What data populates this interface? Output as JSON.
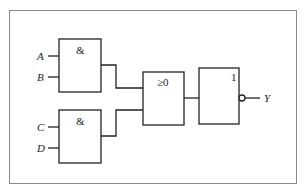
{
  "diagram": {
    "type": "logic-circuit",
    "inputs": [
      "A",
      "B",
      "C",
      "D"
    ],
    "output": "Y",
    "gates": [
      {
        "id": "and1",
        "symbol": "&",
        "inputs": [
          "A",
          "B"
        ]
      },
      {
        "id": "and2",
        "symbol": "&",
        "inputs": [
          "C",
          "D"
        ]
      },
      {
        "id": "or1",
        "symbol": "≥0",
        "inputs": [
          "and1",
          "and2"
        ]
      },
      {
        "id": "not1",
        "symbol": "1",
        "inputs": [
          "or1"
        ],
        "inverted_output": true
      }
    ]
  },
  "labels": {
    "a": "A",
    "b": "B",
    "c": "C",
    "d": "D",
    "y": "Y",
    "and1_symbol": "&",
    "and2_symbol": "&",
    "or_symbol": "≥0",
    "not_symbol": "1"
  },
  "colors": {
    "line": "#222222",
    "frame": "#8a8a8a",
    "background": "#ffffff"
  }
}
